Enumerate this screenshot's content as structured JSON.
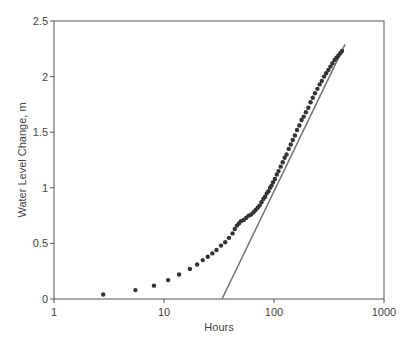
{
  "chart_data": {
    "type": "scatter",
    "title": "",
    "xlabel": "Hours",
    "ylabel": "Water Level Change, m",
    "xscale": "log",
    "xlim": [
      1,
      1000
    ],
    "ylim": [
      0,
      2.5
    ],
    "x_ticks": [
      1,
      10,
      100,
      1000
    ],
    "x_tick_labels": [
      "1",
      "10",
      "100",
      "1000"
    ],
    "y_ticks": [
      0,
      0.5,
      1,
      1.5,
      2,
      2.5
    ],
    "y_tick_labels": [
      "0",
      "0.5",
      "1",
      "1.5",
      "2",
      "2.5"
    ],
    "grid": false,
    "legend": null,
    "series": [
      {
        "name": "Observed water level change",
        "kind": "scatter",
        "color": "#333333",
        "x": [
          2.8,
          5.5,
          8.1,
          10.9,
          13.7,
          17.2,
          20,
          22.5,
          25,
          27.5,
          30,
          33,
          36,
          39,
          42,
          44,
          46,
          48,
          50,
          53,
          56,
          59,
          62,
          65,
          68,
          71,
          74,
          77,
          80,
          83,
          86,
          89,
          92,
          95,
          98,
          102,
          106,
          110,
          115,
          120,
          125,
          130,
          136,
          142,
          148,
          155,
          162,
          170,
          178,
          186,
          195,
          205,
          215,
          225,
          236,
          248,
          260,
          272,
          285,
          298,
          312,
          326,
          340,
          355,
          370,
          385,
          400,
          415
        ],
        "y": [
          0.04,
          0.08,
          0.12,
          0.17,
          0.22,
          0.27,
          0.31,
          0.35,
          0.38,
          0.41,
          0.44,
          0.48,
          0.51,
          0.55,
          0.59,
          0.63,
          0.66,
          0.68,
          0.7,
          0.71,
          0.73,
          0.75,
          0.76,
          0.78,
          0.8,
          0.82,
          0.84,
          0.87,
          0.9,
          0.92,
          0.95,
          0.97,
          1.0,
          1.02,
          1.05,
          1.08,
          1.12,
          1.15,
          1.19,
          1.23,
          1.27,
          1.3,
          1.35,
          1.39,
          1.43,
          1.47,
          1.52,
          1.56,
          1.61,
          1.64,
          1.68,
          1.72,
          1.77,
          1.81,
          1.85,
          1.89,
          1.93,
          1.96,
          2.0,
          2.03,
          2.06,
          2.09,
          2.12,
          2.15,
          2.17,
          2.19,
          2.21,
          2.23
        ]
      },
      {
        "name": "Semi-log straight line fit",
        "kind": "line",
        "color": "#777777",
        "x": [
          33.7,
          442
        ],
        "y": [
          0,
          2.29
        ]
      }
    ]
  }
}
